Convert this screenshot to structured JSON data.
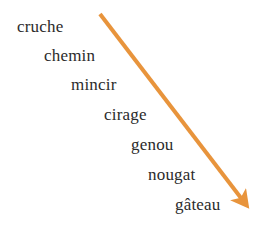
{
  "image": {
    "title": "Liste de mots en escalier descendant",
    "width": 258,
    "height": 236,
    "background_color": "#ffffff"
  },
  "colors": {
    "text": "#2b2b2b",
    "arrow": "#e8943c",
    "background": "#ffffff"
  },
  "word_list": {
    "name": "descending-word-staircase",
    "count": 7,
    "items": [
      {
        "text": "cruche",
        "x": 17,
        "y": 18
      },
      {
        "text": "chemin",
        "x": 44,
        "y": 47
      },
      {
        "text": "mincir",
        "x": 71,
        "y": 76
      },
      {
        "text": "cirage",
        "x": 104,
        "y": 106
      },
      {
        "text": "genou",
        "x": 131,
        "y": 136
      },
      {
        "text": "nougat",
        "x": 148,
        "y": 166
      },
      {
        "text": "gâteau",
        "x": 175,
        "y": 196
      }
    ]
  },
  "arrow": {
    "name": "descending-diagonal-arrow",
    "color": "#e8943c",
    "start_x": 100,
    "start_y": 14,
    "end_x": 248,
    "end_y": 206,
    "stroke_width": 4,
    "head_size": 13,
    "direction": "down-right"
  }
}
